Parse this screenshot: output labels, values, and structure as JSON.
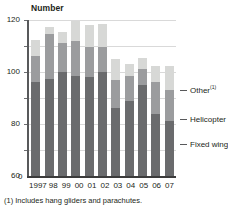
{
  "chart_data": {
    "type": "bar",
    "subtype": "stacked-vertical",
    "title": "",
    "ylabel": "Number",
    "xlabel": "",
    "ylim": [
      0,
      120
    ],
    "yticks": [
      0,
      20,
      40,
      60,
      80,
      100,
      120
    ],
    "grid": true,
    "legend_position": "right-callouts",
    "categories": [
      "1997",
      "98",
      "99",
      "00",
      "01",
      "02",
      "03",
      "04",
      "05",
      "06",
      "07"
    ],
    "series": [
      {
        "name": "Fixed wing",
        "color": "#6a6b6d",
        "values": [
          72,
          75,
          80,
          77,
          76,
          80,
          52,
          58,
          70,
          48,
          42
        ]
      },
      {
        "name": "Helicopter",
        "color": "#9b9c9e",
        "values": [
          20,
          34,
          22,
          27,
          23,
          19,
          22,
          19,
          12,
          24,
          24
        ]
      },
      {
        "name": "Other",
        "color": "#d7d8d6",
        "values": [
          13,
          6,
          9,
          15,
          17,
          18,
          16,
          9,
          9,
          13,
          19
        ]
      }
    ],
    "totals": [
      105,
      115,
      111,
      119,
      116,
      117,
      90,
      86,
      91,
      85,
      85
    ],
    "annotations": [
      "(1) Includes hang gliders and parachutes."
    ]
  },
  "axis": {
    "y_title": "Number",
    "y_ticks": [
      "120",
      "100",
      "80",
      "60",
      "40",
      "20"
    ],
    "zero_label": "0",
    "x_labels": [
      "1997",
      "98",
      "99",
      "00",
      "01",
      "02",
      "03",
      "04",
      "05",
      "06",
      "07"
    ]
  },
  "legend": {
    "other_label": "Other",
    "other_footnote_marker": "(1)",
    "helicopter_label": "Helicopter",
    "fixed_wing_label": "Fixed wing"
  },
  "footnote": {
    "text": "(1) Includes hang gliders and parachutes."
  }
}
